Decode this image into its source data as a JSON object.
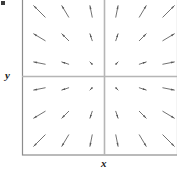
{
  "figure": {
    "title": "",
    "axis_labels": {
      "x": "x",
      "y": "y"
    },
    "colors": {
      "frame": "#8c8c8c",
      "axis": "#b5b5b5",
      "arrow": "#585858",
      "background": "#ffffff",
      "label": "#1a1a1a"
    },
    "frame": {
      "left": 22,
      "top": 0,
      "right": 177,
      "bottom": 155
    },
    "origin": {
      "x": 104,
      "y": 76
    }
  },
  "chart_data": {
    "type": "scatter",
    "plot_kind": "vector-field-quiver",
    "title": "",
    "xlabel": "x",
    "ylabel": "y",
    "grid": false,
    "legend": null,
    "xlim": [
      -3,
      3
    ],
    "ylim": [
      -3,
      3
    ],
    "xticks": [],
    "yticks": [],
    "field_expression": "F(x, y) = (x, y)",
    "grid_x": [
      -2.5,
      -1.5,
      -0.5,
      0.5,
      1.5,
      2.5
    ],
    "grid_y": [
      2.5,
      1.5,
      0.5,
      -0.5,
      -1.5,
      -2.5
    ],
    "vectors": [
      {
        "x": -2.5,
        "y": 2.5,
        "u": -2.5,
        "v": 2.5
      },
      {
        "x": -1.5,
        "y": 2.5,
        "u": -1.5,
        "v": 2.5
      },
      {
        "x": -0.5,
        "y": 2.5,
        "u": -0.5,
        "v": 2.5
      },
      {
        "x": 0.5,
        "y": 2.5,
        "u": 0.5,
        "v": 2.5
      },
      {
        "x": 1.5,
        "y": 2.5,
        "u": 1.5,
        "v": 2.5
      },
      {
        "x": 2.5,
        "y": 2.5,
        "u": 2.5,
        "v": 2.5
      },
      {
        "x": -2.5,
        "y": 1.5,
        "u": -2.5,
        "v": 1.5
      },
      {
        "x": -1.5,
        "y": 1.5,
        "u": -1.5,
        "v": 1.5
      },
      {
        "x": -0.5,
        "y": 1.5,
        "u": -0.5,
        "v": 1.5
      },
      {
        "x": 0.5,
        "y": 1.5,
        "u": 0.5,
        "v": 1.5
      },
      {
        "x": 1.5,
        "y": 1.5,
        "u": 1.5,
        "v": 1.5
      },
      {
        "x": 2.5,
        "y": 1.5,
        "u": 2.5,
        "v": 1.5
      },
      {
        "x": -2.5,
        "y": 0.5,
        "u": -2.5,
        "v": 0.5
      },
      {
        "x": -1.5,
        "y": 0.5,
        "u": -1.5,
        "v": 0.5
      },
      {
        "x": -0.5,
        "y": 0.5,
        "u": -0.5,
        "v": 0.5
      },
      {
        "x": 0.5,
        "y": 0.5,
        "u": 0.5,
        "v": 0.5
      },
      {
        "x": 1.5,
        "y": 0.5,
        "u": 1.5,
        "v": 0.5
      },
      {
        "x": 2.5,
        "y": 0.5,
        "u": 2.5,
        "v": 0.5
      },
      {
        "x": -2.5,
        "y": -0.5,
        "u": -2.5,
        "v": -0.5
      },
      {
        "x": -1.5,
        "y": -0.5,
        "u": -1.5,
        "v": -0.5
      },
      {
        "x": -0.5,
        "y": -0.5,
        "u": -0.5,
        "v": -0.5
      },
      {
        "x": 0.5,
        "y": -0.5,
        "u": 0.5,
        "v": -0.5
      },
      {
        "x": 1.5,
        "y": -0.5,
        "u": 1.5,
        "v": -0.5
      },
      {
        "x": 2.5,
        "y": -0.5,
        "u": 2.5,
        "v": -0.5
      },
      {
        "x": -2.5,
        "y": -1.5,
        "u": -2.5,
        "v": -1.5
      },
      {
        "x": -1.5,
        "y": -1.5,
        "u": -1.5,
        "v": -1.5
      },
      {
        "x": -0.5,
        "y": -1.5,
        "u": -0.5,
        "v": -1.5
      },
      {
        "x": 0.5,
        "y": -1.5,
        "u": 0.5,
        "v": -1.5
      },
      {
        "x": 1.5,
        "y": -1.5,
        "u": 1.5,
        "v": -1.5
      },
      {
        "x": 2.5,
        "y": -1.5,
        "u": 2.5,
        "v": -1.5
      },
      {
        "x": -2.5,
        "y": -2.5,
        "u": -2.5,
        "v": -2.5
      },
      {
        "x": -1.5,
        "y": -2.5,
        "u": -1.5,
        "v": -2.5
      },
      {
        "x": -0.5,
        "y": -2.5,
        "u": -0.5,
        "v": -2.5
      },
      {
        "x": 0.5,
        "y": -2.5,
        "u": 0.5,
        "v": -2.5
      },
      {
        "x": 1.5,
        "y": -2.5,
        "u": 1.5,
        "v": -2.5
      },
      {
        "x": 2.5,
        "y": -2.5,
        "u": 2.5,
        "v": -2.5
      }
    ]
  }
}
